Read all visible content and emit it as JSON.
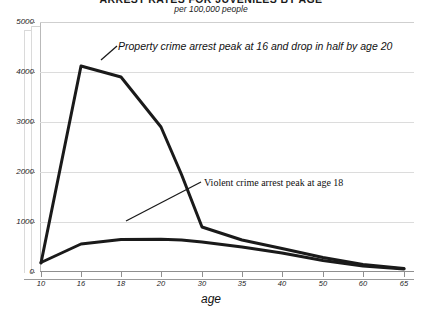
{
  "chart_data": {
    "type": "line",
    "title": "ARREST RATES FOR JUVENILES BY AGE",
    "subtitle": "per 100,000 people",
    "xlabel": "age",
    "ylabel": "",
    "xlim": [
      10,
      66
    ],
    "ylim": [
      0,
      5000
    ],
    "grid": true,
    "legend_position": "none",
    "x_ticks": [
      10,
      16,
      18,
      20,
      30,
      35,
      40,
      50,
      60,
      65
    ],
    "y_ticks": [
      0,
      1000,
      2000,
      3000,
      4000,
      5000
    ],
    "series": [
      {
        "name": "Property crime arrest rate",
        "color": "#1a1a1a",
        "x": [
          10,
          16,
          18,
          20,
          25,
          30,
          35,
          40,
          50,
          60,
          65
        ],
        "values": [
          180,
          4120,
          3900,
          2900,
          1950,
          900,
          640,
          470,
          290,
          150,
          70
        ]
      },
      {
        "name": "Violent crime arrest rate",
        "color": "#1a1a1a",
        "x": [
          10,
          16,
          18,
          20,
          25,
          30,
          35,
          40,
          50,
          60,
          65
        ],
        "values": [
          190,
          560,
          650,
          655,
          640,
          600,
          500,
          380,
          230,
          120,
          60
        ]
      }
    ],
    "annotations": [
      {
        "id": "property-peak",
        "text": "Property crime arrest peak at 16 and drop in half by  age 20"
      },
      {
        "id": "violent-peak",
        "text": "Violent crime arrest peak at age 18"
      }
    ]
  },
  "axes": {
    "y_tick_labels": [
      "5000",
      "4000",
      "3000",
      "2000",
      "1000",
      "0"
    ],
    "x_tick_labels": [
      "10",
      "16",
      "18",
      "20",
      "30",
      "35",
      "40",
      "50",
      "60",
      "65"
    ]
  }
}
